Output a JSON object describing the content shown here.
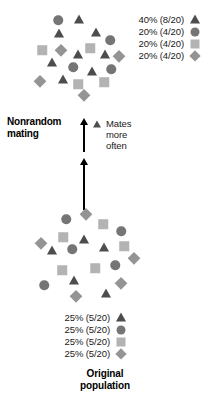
{
  "figure": {
    "caption": "Original\npopulation",
    "caption_line1": "Original",
    "caption_line2": "population",
    "process_label_line1": "Nonrandom",
    "process_label_line2": "mating",
    "annotation": {
      "marker": "triangle",
      "line1": "Mates",
      "line2": "more",
      "line3": "often"
    }
  },
  "palette": {
    "triangle": "#4d4d4d",
    "circle": "#757575",
    "square": "#b3b3b3",
    "diamond": "#949494",
    "arrow": "#000000",
    "text": "#1a1a1a",
    "background": "#ffffff"
  },
  "chart_data": {
    "type": "scatter",
    "populations": [
      {
        "name": "resulting-population",
        "position": "top",
        "total": 20,
        "legend": [
          {
            "percent": "40%",
            "fraction": "(8/20)",
            "label": "40% (8/20)",
            "shape": "triangle",
            "count": 8
          },
          {
            "percent": "20%",
            "fraction": "(4/20)",
            "label": "20% (4/20)",
            "shape": "circle",
            "count": 4
          },
          {
            "percent": "20%",
            "fraction": "(4/20)",
            "label": "20% (4/20)",
            "shape": "square",
            "count": 4
          },
          {
            "percent": "20%",
            "fraction": "(4/20)",
            "label": "20% (4/20)",
            "shape": "diamond",
            "count": 4
          }
        ],
        "points": [
          {
            "shape": "circle",
            "x": 58,
            "y": 20
          },
          {
            "shape": "triangle",
            "x": 79,
            "y": 20
          },
          {
            "shape": "triangle",
            "x": 59,
            "y": 34
          },
          {
            "shape": "triangle",
            "x": 96,
            "y": 33
          },
          {
            "shape": "circle",
            "x": 110,
            "y": 40
          },
          {
            "shape": "square",
            "x": 42,
            "y": 50
          },
          {
            "shape": "diamond",
            "x": 61,
            "y": 50
          },
          {
            "shape": "square",
            "x": 90,
            "y": 48
          },
          {
            "shape": "triangle",
            "x": 78,
            "y": 55
          },
          {
            "shape": "triangle",
            "x": 105,
            "y": 55
          },
          {
            "shape": "diamond",
            "x": 119,
            "y": 56
          },
          {
            "shape": "triangle",
            "x": 52,
            "y": 63
          },
          {
            "shape": "circle",
            "x": 73,
            "y": 67
          },
          {
            "shape": "triangle",
            "x": 92,
            "y": 72
          },
          {
            "shape": "circle",
            "x": 111,
            "y": 69
          },
          {
            "shape": "diamond",
            "x": 40,
            "y": 81
          },
          {
            "shape": "triangle",
            "x": 63,
            "y": 80
          },
          {
            "shape": "square",
            "x": 78,
            "y": 84
          },
          {
            "shape": "square",
            "x": 104,
            "y": 82
          },
          {
            "shape": "diamond",
            "x": 84,
            "y": 95
          }
        ]
      },
      {
        "name": "original-population",
        "position": "bottom",
        "total": 20,
        "legend": [
          {
            "percent": "25%",
            "fraction": "(5/20)",
            "label": "25% (5/20)",
            "shape": "triangle",
            "count": 5
          },
          {
            "percent": "25%",
            "fraction": "(5/20)",
            "label": "25% (5/20)",
            "shape": "circle",
            "count": 5
          },
          {
            "percent": "25%",
            "fraction": "(5/20)",
            "label": "25% (5/20)",
            "shape": "square",
            "count": 5
          },
          {
            "percent": "25%",
            "fraction": "(5/20)",
            "label": "25% (5/20)",
            "shape": "diamond",
            "count": 5
          }
        ],
        "points": [
          {
            "shape": "circle",
            "x": 66,
            "y": 219
          },
          {
            "shape": "diamond",
            "x": 86,
            "y": 214
          },
          {
            "shape": "square",
            "x": 103,
            "y": 224
          },
          {
            "shape": "circle",
            "x": 121,
            "y": 231
          },
          {
            "shape": "square",
            "x": 63,
            "y": 237
          },
          {
            "shape": "triangle",
            "x": 84,
            "y": 240
          },
          {
            "shape": "diamond",
            "x": 41,
            "y": 243
          },
          {
            "shape": "triangle",
            "x": 104,
            "y": 248
          },
          {
            "shape": "square",
            "x": 124,
            "y": 246
          },
          {
            "shape": "triangle",
            "x": 52,
            "y": 251
          },
          {
            "shape": "circle",
            "x": 72,
            "y": 249
          },
          {
            "shape": "diamond",
            "x": 134,
            "y": 258
          },
          {
            "shape": "square",
            "x": 62,
            "y": 270
          },
          {
            "shape": "square",
            "x": 95,
            "y": 268
          },
          {
            "shape": "circle",
            "x": 115,
            "y": 265
          },
          {
            "shape": "triangle",
            "x": 74,
            "y": 281
          },
          {
            "shape": "circle",
            "x": 44,
            "y": 285
          },
          {
            "shape": "diamond",
            "x": 121,
            "y": 283
          },
          {
            "shape": "diamond",
            "x": 76,
            "y": 296
          },
          {
            "shape": "triangle",
            "x": 106,
            "y": 294
          }
        ]
      }
    ],
    "arrows": [
      {
        "name": "upper-arrow",
        "x": 83,
        "y_top": 118,
        "y_bottom": 152,
        "direction": "up"
      },
      {
        "name": "lower-arrow",
        "x": 83,
        "y_top": 158,
        "y_bottom": 210,
        "direction": "up"
      }
    ]
  }
}
